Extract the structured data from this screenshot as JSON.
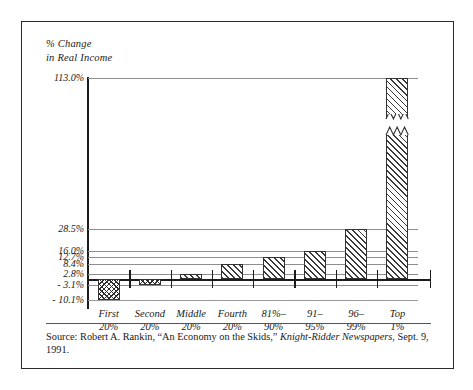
{
  "figure": {
    "axis_title_line1": "% Change",
    "axis_title_line2": "in Real Income",
    "source_prefix": "Source: Robert A. Rankin, “An Economy on the Skids,” ",
    "source_italic": "Knight-Ridder Newspapers",
    "source_suffix": ", Sept. 9, 1991.",
    "border_color": "#2b2b2b",
    "grid_color": "#8e8e8e",
    "axis_color": "#1c1c1c",
    "hatch_color": "#3a3a3a"
  },
  "chart_data": {
    "type": "bar",
    "title": "",
    "subtitle": "",
    "xlabel": "",
    "ylabel": "% Change in Real Income",
    "categories": [
      "First 20%",
      "Second 20%",
      "Middle 20%",
      "Fourth 20%",
      "81%-90%",
      "91-95%",
      "96-99%",
      "Top 1%"
    ],
    "category_labels": [
      {
        "line1": "First",
        "line2": "20%"
      },
      {
        "line1": "Second",
        "line2": "20%"
      },
      {
        "line1": "Middle",
        "line2": "20%"
      },
      {
        "line1": "Fourth",
        "line2": "20%"
      },
      {
        "line1": "81%–",
        "line2": "90%"
      },
      {
        "line1": "91–",
        "line2": "95%"
      },
      {
        "line1": "96–",
        "line2": "99%"
      },
      {
        "line1": "Top",
        "line2": "1%"
      }
    ],
    "values": [
      -10.1,
      -3.1,
      2.8,
      8.4,
      12.7,
      16.0,
      28.5,
      113.0
    ],
    "value_labels": [
      "-10.1%",
      "-3.1%",
      "2.8%",
      "8.4%",
      "12.7%",
      "16.0%",
      "28.5%",
      "113.0%"
    ],
    "ytick_labels": [
      "113.0%",
      "28.5%",
      "16.0%",
      "12.7%",
      "8.4%",
      "2.8%",
      "- 3.1%",
      "- 10.1%"
    ],
    "yticks": [
      113.0,
      28.5,
      16.0,
      12.7,
      8.4,
      2.8,
      -3.1,
      -10.1
    ],
    "ylim": [
      -10.1,
      113.0
    ],
    "grid": true,
    "legend": "none",
    "axis_break": true,
    "axis_break_series": "Top 1%"
  }
}
